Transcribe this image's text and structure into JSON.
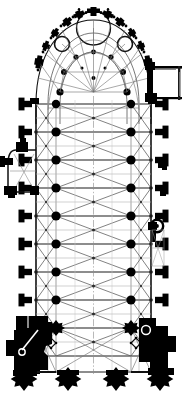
{
  "document": {
    "kind": "architectural-floor-plan",
    "subject": "Gothic cathedral ground plan",
    "orientation": "apse at top, west front at bottom",
    "caption": "",
    "palette": {
      "background": "#ffffff",
      "masonry": "#000000",
      "rib_line": "#3a3a3a",
      "faint_line": "#8c8c8c",
      "wall_line": "#111111"
    },
    "canvas": {
      "width": 187,
      "height": 396
    }
  },
  "plan": {
    "axis": {
      "x": 93.5,
      "label": "longitudinal-axis"
    },
    "outline": {
      "nave_left_x": 36,
      "nave_right_x": 151,
      "nave_top_y": 120,
      "nave_bottom_y": 372,
      "apse_center_y": 95,
      "apse_radius_x": 58,
      "apse_radius_y": 72
    },
    "bays": {
      "count": 9,
      "y_positions": [
        104,
        132,
        160,
        188,
        216,
        244,
        272,
        300,
        328,
        356
      ],
      "aisle_left_x": 56,
      "aisle_right_x": 131
    },
    "piers": {
      "note": "main arcade piers, paired left and right of nave axis",
      "left_x": 56,
      "right_x": 131,
      "y_positions": [
        104,
        132,
        160,
        188,
        216,
        244,
        272,
        300,
        328,
        356
      ],
      "radius_major": 4.6,
      "radius_minor": 2.2
    },
    "apse": {
      "type": "chevet with radiating chapels",
      "chapel_count": 7,
      "ambulatory_radius_x": 46,
      "ambulatory_radius_y": 58,
      "hemicycle_pier_count": 7,
      "axial_chapel_label": "lady-chapel"
    },
    "buttresses": {
      "left_count": 8,
      "right_count": 8,
      "depth": 12,
      "width": 9,
      "y_positions": [
        118,
        146,
        174,
        202,
        230,
        258,
        286,
        314
      ]
    },
    "annex": {
      "name": "sacristy-annex",
      "x": 151,
      "y": 66,
      "width": 32,
      "height": 36,
      "style": "thin-outline"
    },
    "side_chapel": {
      "name": "north-side-chapel",
      "x": 12,
      "y": 150,
      "width": 26,
      "height": 42
    },
    "stair_turret": {
      "name": "spiral-stair-turret",
      "cx": 152,
      "cy": 226,
      "r": 6
    },
    "west_front": {
      "name": "west-facade",
      "tower_left": {
        "x": 16,
        "y": 318,
        "width": 34,
        "height": 56
      },
      "tower_right": {
        "x": 136,
        "y": 318,
        "width": 34,
        "height": 56
      },
      "portal_buttress_count": 4,
      "portal_buttress_x": [
        24,
        66,
        116,
        158
      ],
      "portal_buttress_y": 372,
      "rose_window_bay": true
    },
    "vaults": {
      "type": "quadripartite-rib-vaults",
      "nave_bay_count": 9,
      "aisle_bay_count": 9,
      "diagonal_ribs": true,
      "transverse_ribs": true
    }
  },
  "labels": {
    "apse": "Apse / Chevet",
    "ambulatory": "Ambulatory",
    "radiating_chapels": "Radiating chapels",
    "choir": "Choir",
    "nave": "Nave",
    "north_aisle": "North aisle",
    "south_aisle": "South aisle",
    "sacristy": "Sacristy annex",
    "side_chapel": "Side chapel",
    "stair_turret": "Stair turret",
    "west_front": "West front",
    "tower_north": "North tower",
    "tower_south": "South tower",
    "portal": "Main portal"
  }
}
